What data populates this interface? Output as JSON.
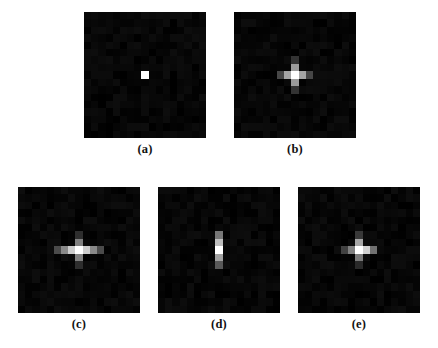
{
  "figure": {
    "background_color": "#ffffff",
    "panel_background_color": "#050505",
    "label_color": "#111111"
  },
  "chart_data": {
    "type": "heatmap",
    "title": "",
    "xlabel": "",
    "ylabel": "",
    "grid": false,
    "legend": "none",
    "colormap": "grayscale",
    "value_range": [
      0,
      1
    ],
    "grid_size": [
      17,
      17
    ],
    "panels": [
      {
        "id": "a",
        "label": "(a)",
        "pattern": "single-point",
        "cells": [
          {
            "col": 8,
            "row": 8,
            "value": 1.0
          }
        ]
      },
      {
        "id": "b",
        "label": "(b)",
        "pattern": "symmetric-cross",
        "cells": [
          {
            "col": 8,
            "row": 8,
            "value": 1.0
          },
          {
            "col": 7,
            "row": 8,
            "value": 0.62
          },
          {
            "col": 9,
            "row": 8,
            "value": 0.62
          },
          {
            "col": 8,
            "row": 7,
            "value": 0.58
          },
          {
            "col": 8,
            "row": 9,
            "value": 0.58
          },
          {
            "col": 6,
            "row": 8,
            "value": 0.22
          },
          {
            "col": 10,
            "row": 8,
            "value": 0.22
          },
          {
            "col": 8,
            "row": 6,
            "value": 0.14
          },
          {
            "col": 8,
            "row": 10,
            "value": 0.14
          }
        ]
      },
      {
        "id": "c",
        "label": "(c)",
        "pattern": "horizontally-elongated-cross",
        "cells": [
          {
            "col": 8,
            "row": 8,
            "value": 1.0
          },
          {
            "col": 7,
            "row": 8,
            "value": 0.78
          },
          {
            "col": 9,
            "row": 8,
            "value": 0.78
          },
          {
            "col": 6,
            "row": 8,
            "value": 0.5
          },
          {
            "col": 10,
            "row": 8,
            "value": 0.5
          },
          {
            "col": 5,
            "row": 8,
            "value": 0.24
          },
          {
            "col": 11,
            "row": 8,
            "value": 0.24
          },
          {
            "col": 8,
            "row": 7,
            "value": 0.46
          },
          {
            "col": 8,
            "row": 9,
            "value": 0.46
          },
          {
            "col": 8,
            "row": 6,
            "value": 0.12
          },
          {
            "col": 8,
            "row": 10,
            "value": 0.12
          }
        ]
      },
      {
        "id": "d",
        "label": "(d)",
        "pattern": "vertical-bar",
        "cells": [
          {
            "col": 8,
            "row": 8,
            "value": 1.0
          },
          {
            "col": 8,
            "row": 7,
            "value": 0.72
          },
          {
            "col": 8,
            "row": 9,
            "value": 0.6
          },
          {
            "col": 8,
            "row": 6,
            "value": 0.42
          },
          {
            "col": 8,
            "row": 10,
            "value": 0.3
          }
        ]
      },
      {
        "id": "e",
        "label": "(e)",
        "pattern": "asymmetric-cross",
        "cells": [
          {
            "col": 8,
            "row": 8,
            "value": 1.0
          },
          {
            "col": 9,
            "row": 8,
            "value": 0.8
          },
          {
            "col": 7,
            "row": 8,
            "value": 0.46
          },
          {
            "col": 10,
            "row": 8,
            "value": 0.4
          },
          {
            "col": 6,
            "row": 8,
            "value": 0.2
          },
          {
            "col": 8,
            "row": 7,
            "value": 0.62
          },
          {
            "col": 8,
            "row": 9,
            "value": 0.44
          },
          {
            "col": 8,
            "row": 6,
            "value": 0.16
          },
          {
            "col": 8,
            "row": 10,
            "value": 0.1
          }
        ]
      }
    ]
  }
}
